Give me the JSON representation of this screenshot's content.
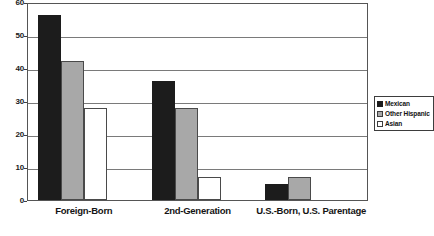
{
  "chart_data": {
    "type": "bar",
    "title": "",
    "subtitle": "",
    "xlabel": "",
    "ylabel": "",
    "categories": [
      "Foreign-Born",
      "2nd-Generation",
      "U.S.-Born, U.S. Parentage"
    ],
    "series": [
      {
        "name": "Mexican",
        "color": "#1c1c1c",
        "values": [
          56,
          36,
          5
        ]
      },
      {
        "name": "Other Hispanic",
        "color": "#a8a8a8",
        "values": [
          42,
          28,
          7
        ]
      },
      {
        "name": "Asian",
        "color": "#ffffff",
        "values": [
          28,
          7,
          0
        ]
      }
    ],
    "ylim": [
      0,
      60
    ],
    "yticks": [
      0,
      10,
      20,
      30,
      40,
      50,
      60
    ],
    "ytick_labels": [
      "0",
      "10",
      "20",
      "30",
      "40",
      "50",
      "60"
    ],
    "grid": true,
    "grid_axis": "y",
    "legend_position": "right",
    "legend_entries": [
      "Mexican",
      "Other Hispanic",
      "Asian"
    ]
  },
  "axes": {
    "y": {
      "ticks": [
        {
          "value": 60,
          "label": "60"
        },
        {
          "value": 50,
          "label": "50"
        },
        {
          "value": 40,
          "label": "40"
        },
        {
          "value": 30,
          "label": "30"
        },
        {
          "value": 20,
          "label": "20"
        },
        {
          "value": 10,
          "label": "10"
        },
        {
          "value": 0,
          "label": "0"
        }
      ]
    },
    "x": {
      "ticks": [
        {
          "label": "Foreign-Born"
        },
        {
          "label": "2nd-Generation"
        },
        {
          "label": "U.S.-Born, U.S. Parentage"
        }
      ]
    }
  },
  "legend": {
    "items": [
      {
        "label": "Mexican",
        "swatch": "legend-swatch-mexican"
      },
      {
        "label": "Other Hispanic",
        "swatch": "legend-swatch-other-hispanic"
      },
      {
        "label": "Asian",
        "swatch": "legend-swatch-asian"
      }
    ]
  }
}
